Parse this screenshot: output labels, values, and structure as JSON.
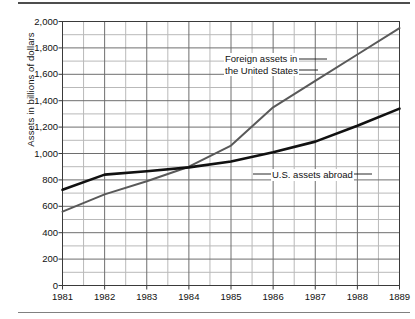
{
  "figure": {
    "name": "international-assets-line-chart",
    "background": "#ffffff",
    "rules": {
      "top": "#4d4d4d",
      "bottom": "#808080"
    }
  },
  "chart_data": {
    "type": "line",
    "title": "",
    "xlabel": "",
    "ylabel": "Assets in billions of dollars",
    "xlim": [
      1981,
      1989
    ],
    "ylim": [
      0,
      2000
    ],
    "grid": true,
    "grid_y_step": 100,
    "grid_x_step": 0.5,
    "legend": "inline-annotations",
    "ytick_labels": [
      "0",
      "200",
      "400",
      "600",
      "800",
      "1,000",
      "1,200",
      "1,400",
      "1,600",
      "1,800",
      "2,000"
    ],
    "ytick_values": [
      0,
      200,
      400,
      600,
      800,
      1000,
      1200,
      1400,
      1600,
      1800,
      2000
    ],
    "xtick_labels": [
      "1981",
      "1982",
      "1983",
      "1984",
      "1985",
      "1986",
      "1987",
      "1988",
      "1889"
    ],
    "xtick_values": [
      1981,
      1982,
      1983,
      1984,
      1985,
      1986,
      1987,
      1988,
      1989
    ],
    "categories": [
      1981,
      1982,
      1983,
      1984,
      1985,
      1986,
      1987,
      1988,
      1989
    ],
    "series": [
      {
        "name": "Foreign assets in the United States",
        "color": "#595959",
        "width": 2.0,
        "values": [
          560,
          690,
          790,
          900,
          1060,
          1350,
          1550,
          1750,
          1950
        ]
      },
      {
        "name": "U.S. assets abroad",
        "color": "#111111",
        "width": 2.6,
        "values": [
          725,
          840,
          865,
          895,
          940,
          1010,
          1090,
          1210,
          1340
        ]
      }
    ],
    "annotations": [
      {
        "text_lines": [
          "Foreign assets in",
          "the United States"
        ],
        "series": "Foreign assets in the United States"
      },
      {
        "text_lines": [
          "U.S. assets abroad"
        ],
        "series": "U.S. assets abroad"
      }
    ]
  }
}
